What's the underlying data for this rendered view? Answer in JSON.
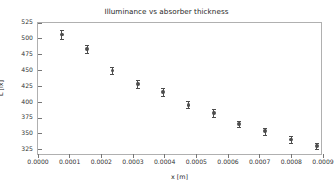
{
  "chart_data": {
    "type": "scatter",
    "title": "Illuminance vs absorber thickness",
    "xlabel": "x [m]",
    "ylabel": "L [lx]",
    "xlim": [
      0.0,
      0.0009
    ],
    "ylim": [
      315,
      525
    ],
    "grid": false,
    "legend": null,
    "xticks": [
      "0.0000",
      "0.0001",
      "0.0002",
      "0.0003",
      "0.0004",
      "0.0005",
      "0.0006",
      "0.0007",
      "0.0008",
      "0.0009"
    ],
    "xtick_values": [
      0.0,
      0.0001,
      0.0002,
      0.0003,
      0.0004,
      0.0005,
      0.0006,
      0.0007,
      0.0008,
      0.0009
    ],
    "yticks": [
      "325",
      "350",
      "375",
      "400",
      "425",
      "450",
      "475",
      "500",
      "525"
    ],
    "ytick_values": [
      325,
      350,
      375,
      400,
      425,
      450,
      475,
      500,
      525
    ],
    "series": [
      {
        "name": "measurement",
        "marker": "circle",
        "color": "#4d4d4d",
        "errorbars": "vertical",
        "x": [
          7.5e-05,
          0.000155,
          0.000235,
          0.000315,
          0.000395,
          0.000475,
          0.000555,
          0.000635,
          0.000718,
          0.0008,
          0.00088
        ],
        "y": [
          507,
          484,
          450,
          429,
          416,
          396,
          383,
          366,
          354,
          341,
          331
        ],
        "yerr": [
          7,
          6,
          5,
          6,
          6,
          6,
          6,
          5,
          6,
          5,
          5
        ]
      }
    ]
  }
}
